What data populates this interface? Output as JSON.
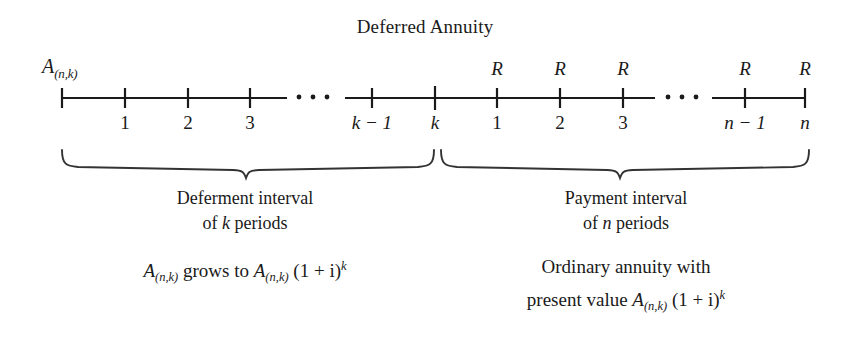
{
  "figure": {
    "title": "Deferred Annuity",
    "type": "timeline-diagram"
  },
  "timeline": {
    "start_label": {
      "base": "A",
      "subscript": "(n,k)"
    },
    "ellipsis": "···",
    "deferment_ticks": [
      "1",
      "2",
      "3"
    ],
    "deferment_end_ticks": [
      "k − 1",
      "k"
    ],
    "payment_ticks": [
      "1",
      "2",
      "3"
    ],
    "payment_end_ticks": [
      "n − 1",
      "n"
    ],
    "payment_markers": [
      "R",
      "R",
      "R",
      "R",
      "R"
    ],
    "payment_marker_symbol": "R"
  },
  "braces": {
    "left": {
      "interval_line1": "Deferment interval",
      "interval_line2_prefix": "of ",
      "interval_line2_var": "k",
      "interval_line2_suffix": " periods",
      "formula": {
        "lead_base": "A",
        "lead_sub": "(n,k)",
        "verb": " grows to ",
        "target_base": "A",
        "target_sub": "(n,k)",
        "factor": "(1 + i)",
        "exponent": "k"
      }
    },
    "right": {
      "interval_line1": "Payment interval",
      "interval_line2_prefix": "of ",
      "interval_line2_var": "n",
      "interval_line2_suffix": " periods",
      "formula": {
        "line1": "Ordinary annuity with",
        "line2_prefix": "present value ",
        "target_base": "A",
        "target_sub": "(n,k)",
        "factor": "(1 + i)",
        "exponent": "k"
      }
    }
  },
  "style": {
    "ink": "#1a1a1a",
    "background": "#ffffff"
  }
}
